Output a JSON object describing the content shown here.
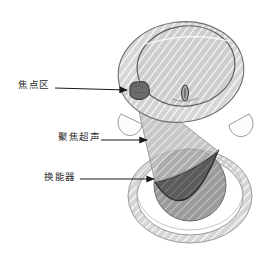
{
  "figure": {
    "background_color": "#ffffff"
  },
  "labels": [
    {
      "id": "focal-zone",
      "text": "焦点区",
      "arrow": {
        "x1": 55,
        "y1": 88,
        "x2": 128,
        "y2": 90
      }
    },
    {
      "id": "focused-ultrasound",
      "text": "聚焦超声",
      "arrow": {
        "x1": 101,
        "y1": 140,
        "x2": 148,
        "y2": 140
      }
    },
    {
      "id": "transducer",
      "text": "换能器",
      "arrow": {
        "x1": 80,
        "y1": 179,
        "x2": 155,
        "y2": 179
      }
    }
  ],
  "colors": {
    "head_outer_fill": "#d2d2d2",
    "head_inner_fill": "#cfcfcf",
    "head_stroke": "#6e6e6e",
    "ear_fill": "#fbfbfb",
    "ear_stroke": "#9a9a9a",
    "nose_fill": "#b8b8b8",
    "nose_stroke": "#4a4a4a",
    "focal_zone_fill": "#6a6a6a",
    "focal_zone_stroke": "#3c3c3c",
    "beam_fill": "#b4b4b4",
    "beam_stroke": "#8f8f8f",
    "sphere_fill": "#9c9c9c",
    "sphere_stroke": "#6a6a6a",
    "transducer_bowl_fill": "#5e5e5e",
    "transducer_bowl_stroke": "#2e2e2e",
    "ring_fill": "#d7d7d7",
    "ring_stroke": "#9a9a9a",
    "ring_inner_fill": "#ffffff",
    "arrow_color": "#1a1a1a",
    "label_color": "#2b2b2b",
    "hatch_color": "#ffffff"
  },
  "geometry": {
    "head_outer": {
      "cx": 181,
      "cy": 72,
      "rx": 63,
      "ry": 50,
      "rotation": -8
    },
    "head_inner": {
      "cx": 186,
      "cy": 67,
      "rx": 49,
      "ry": 40,
      "rotation": -8
    },
    "ear_left": {
      "cx": 131,
      "cy": 121,
      "rx": 12,
      "ry": 13
    },
    "ear_right": {
      "cx": 238,
      "cy": 121,
      "rx": 12,
      "ry": 13
    },
    "nose": {
      "cx": 185,
      "cy": 93,
      "rx": 3.4,
      "ry": 8
    },
    "focal_zone": {
      "cx": 139,
      "cy": 92,
      "rx": 10,
      "ry": 7.5
    },
    "sphere": {
      "cx": 190,
      "cy": 185,
      "r": 36
    },
    "ring_outer": {
      "cx": 190,
      "cy": 196,
      "rx": 62,
      "ry": 47
    },
    "ring_inner": {
      "cx": 190,
      "cy": 196,
      "rx": 53,
      "ry": 39
    },
    "beam_apex": {
      "x": 139,
      "y": 92
    },
    "beam_base": {
      "x1": 155,
      "y1": 182,
      "x2": 218,
      "y2": 151
    }
  }
}
